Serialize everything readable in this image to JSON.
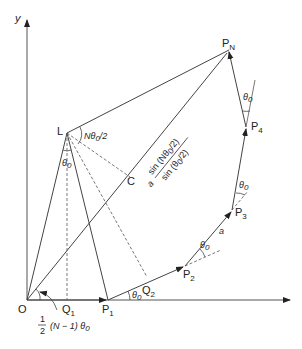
{
  "diagram": {
    "axis_labels": {
      "y": "y",
      "origin": "O"
    },
    "points": {
      "PN": {
        "base": "P",
        "sub": "N"
      },
      "P1": {
        "base": "P",
        "sub": "1"
      },
      "P2": {
        "base": "P",
        "sub": "2"
      },
      "P3": {
        "base": "P",
        "sub": "3"
      },
      "P4": {
        "base": "P",
        "sub": "4"
      },
      "Q1": {
        "base": "Q",
        "sub": "1"
      },
      "Q2": {
        "base": "Q",
        "sub": "2"
      },
      "L": "L",
      "C": "C"
    },
    "angles": {
      "theta0": "θ",
      "theta0_sub": "0",
      "L_top": "Nθ",
      "L_top_tail": "/2",
      "origin_angle_frac_num": "1",
      "origin_angle_frac_den": "2",
      "origin_angle_rest": "(N − 1) θ"
    },
    "segment_label": "a",
    "formula": {
      "prefix": "a",
      "numerator": "sin (Nθ",
      "numerator_tail": "/2)",
      "denominator": "sin (θ",
      "denominator_tail": "/2)"
    },
    "colors": {
      "line": "#444444",
      "text": "#222222"
    }
  }
}
